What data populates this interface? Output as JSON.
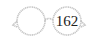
{
  "badge": {
    "icon": "glasses-icon",
    "count": "162",
    "colors": {
      "frame": "#c4c4c4",
      "text": "#222222"
    }
  }
}
